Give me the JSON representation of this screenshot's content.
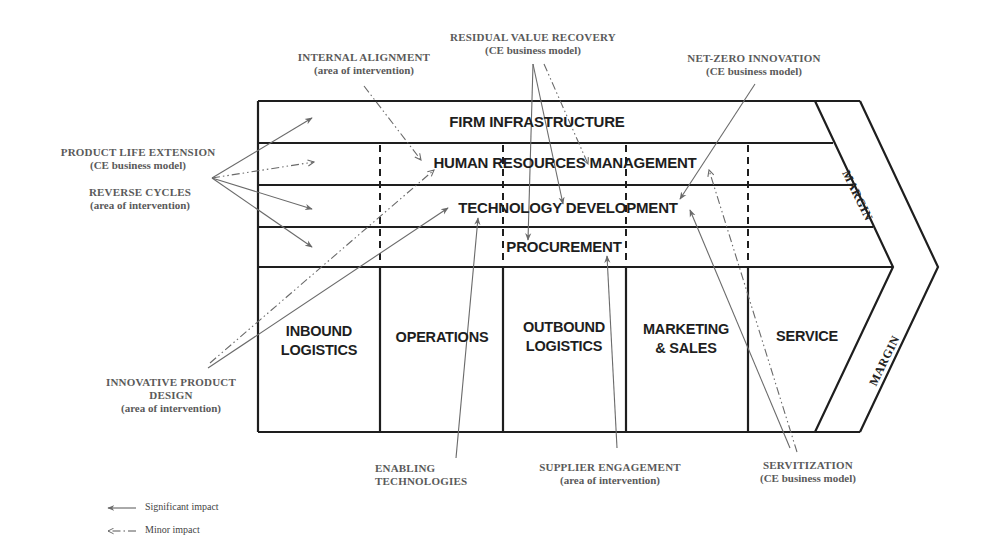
{
  "diagram": {
    "type": "value-chain",
    "support_activities": [
      {
        "label": "FIRM INFRASTRUCTURE"
      },
      {
        "label": "HUMAN RESOURCES MANAGEMENT"
      },
      {
        "label": "TECHNOLOGY DEVELOPMENT"
      },
      {
        "label": "PROCUREMENT"
      }
    ],
    "primary_activities": [
      {
        "line1": "INBOUND",
        "line2": "LOGISTICS"
      },
      {
        "line1": "OPERATIONS",
        "line2": ""
      },
      {
        "line1": "OUTBOUND",
        "line2": "LOGISTICS"
      },
      {
        "line1": "MARKETING",
        "line2": "& SALES"
      },
      {
        "line1": "SERVICE",
        "line2": ""
      }
    ],
    "margin_top": "MARGIN",
    "margin_bottom": "MARGIN"
  },
  "annotations": {
    "internal_alignment": {
      "title": "INTERNAL ALIGNMENT",
      "sub": "(area of intervention)"
    },
    "residual_value_recovery": {
      "title": "RESIDUAL VALUE RECOVERY",
      "sub": "(CE business model)"
    },
    "net_zero_innovation": {
      "title": "NET-ZERO INNOVATION",
      "sub": "(CE business model)"
    },
    "product_life_extension": {
      "title": "PRODUCT LIFE EXTENSION",
      "sub": "(CE business model)"
    },
    "reverse_cycles": {
      "title": "REVERSE CYCLES",
      "sub": "(area of intervention)"
    },
    "innovative_product_design": {
      "title1": "INNOVATIVE PRODUCT",
      "title2": "DESIGN",
      "sub": "(area of intervention)"
    },
    "enabling_technologies": {
      "title1": "ENABLING",
      "title2": "TECHNOLOGIES"
    },
    "supplier_engagement": {
      "title": "SUPPLIER ENGAGEMENT",
      "sub": "(area of intervention)"
    },
    "servitization": {
      "title": "SERVITIZATION",
      "sub": "(CE business model)"
    }
  },
  "legend": {
    "significant": "Significant impact",
    "minor": "Minor impact"
  },
  "colors": {
    "frame": "#1e1e1e",
    "arrow": "#6a6a6a",
    "annotation_text": "#5a5a5a"
  }
}
